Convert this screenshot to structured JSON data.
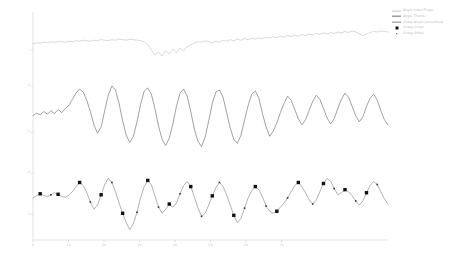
{
  "chart_data": {
    "type": "line",
    "title": "",
    "xlabel": "",
    "ylabel": "",
    "xlim": [
      0,
      100
    ],
    "ylim": [
      -3.2,
      1.2
    ],
    "grid": false,
    "legend_position": "upper right",
    "xticks": [
      0,
      10,
      20,
      30,
      40,
      50,
      60,
      70
    ],
    "xticklabels": [
      "0",
      "10",
      "20",
      "30",
      "40",
      "50",
      "60",
      "70"
    ],
    "yticks": [
      0.5,
      -0.2,
      -1.1,
      -1.9,
      -2.7
    ],
    "yticklabels": [
      "1",
      "0",
      "-1",
      "-2",
      "-3"
    ],
    "series": [
      {
        "name": "Angle Index Finger",
        "color": "#c4c4c4",
        "offset": 0.62,
        "values": [
          0.0,
          0.02,
          0.01,
          0.03,
          0.02,
          0.04,
          0.03,
          0.05,
          0.04,
          0.03,
          0.05,
          0.04,
          0.06,
          0.05,
          0.07,
          0.06,
          0.05,
          0.07,
          0.06,
          0.08,
          0.07,
          0.06,
          0.08,
          0.07,
          0.09,
          0.08,
          0.07,
          0.09,
          0.08,
          0.07,
          0.06,
          0.04,
          -0.02,
          -0.12,
          -0.22,
          -0.16,
          -0.24,
          -0.13,
          -0.2,
          -0.1,
          -0.18,
          -0.08,
          -0.14,
          -0.05,
          -0.02,
          0.02,
          0.04,
          0.03,
          0.06,
          0.04,
          0.02,
          0.05,
          0.03,
          0.07,
          0.05,
          0.08,
          0.06,
          0.09,
          0.07,
          0.1,
          0.08,
          0.11,
          0.09,
          0.12,
          0.1,
          0.13,
          0.11,
          0.14,
          0.12,
          0.15,
          0.13,
          0.16,
          0.14,
          0.17,
          0.15,
          0.18,
          0.16,
          0.19,
          0.17,
          0.2,
          0.18,
          0.21,
          0.19,
          0.22,
          0.2,
          0.23,
          0.21,
          0.24,
          0.22,
          0.25,
          0.23,
          0.2,
          0.16,
          0.19,
          0.22,
          0.24,
          0.23,
          0.25,
          0.24,
          0.23
        ]
      },
      {
        "name": "Angle Thumb",
        "color": "#6d6d6d",
        "offset": -0.78,
        "values": [
          0.0,
          0.05,
          0.02,
          0.08,
          0.03,
          0.1,
          0.04,
          0.12,
          0.06,
          0.14,
          0.2,
          0.32,
          0.44,
          0.52,
          0.46,
          0.3,
          0.08,
          -0.18,
          -0.34,
          -0.22,
          0.1,
          0.4,
          0.58,
          0.5,
          0.24,
          -0.1,
          -0.38,
          -0.52,
          -0.4,
          -0.12,
          0.22,
          0.48,
          0.54,
          0.42,
          0.14,
          -0.2,
          -0.46,
          -0.58,
          -0.44,
          -0.16,
          0.18,
          0.44,
          0.52,
          0.38,
          0.08,
          -0.26,
          -0.5,
          -0.6,
          -0.42,
          -0.1,
          0.24,
          0.46,
          0.5,
          0.36,
          0.06,
          -0.24,
          -0.46,
          -0.54,
          -0.38,
          -0.08,
          0.2,
          0.42,
          0.48,
          0.34,
          0.04,
          -0.22,
          -0.4,
          -0.3,
          -0.14,
          0.06,
          0.24,
          0.38,
          0.3,
          0.12,
          -0.06,
          -0.18,
          -0.08,
          0.1,
          0.28,
          0.4,
          0.32,
          0.14,
          -0.04,
          -0.16,
          -0.06,
          0.14,
          0.32,
          0.44,
          0.36,
          0.18,
          0.0,
          -0.12,
          -0.02,
          0.18,
          0.34,
          0.42,
          0.3,
          0.1,
          -0.08,
          -0.18
        ]
      },
      {
        "name": "Grasp Angle (smoothed)",
        "color": "#888888",
        "offset": -2.38,
        "values": [
          0.0,
          0.04,
          0.08,
          0.05,
          0.02,
          0.06,
          0.1,
          0.07,
          0.03,
          0.01,
          0.05,
          0.12,
          0.22,
          0.3,
          0.24,
          0.1,
          -0.08,
          -0.22,
          -0.14,
          0.06,
          0.26,
          0.38,
          0.3,
          0.12,
          -0.1,
          -0.3,
          -0.48,
          -0.62,
          -0.5,
          -0.28,
          0.0,
          0.22,
          0.34,
          0.26,
          0.04,
          -0.18,
          -0.3,
          -0.22,
          -0.12,
          -0.18,
          -0.1,
          0.08,
          0.24,
          0.32,
          0.22,
          0.02,
          -0.2,
          -0.36,
          -0.3,
          -0.14,
          0.04,
          0.2,
          0.3,
          0.22,
          0.06,
          -0.14,
          -0.34,
          -0.48,
          -0.4,
          -0.2,
          0.0,
          0.14,
          0.22,
          0.16,
          0.02,
          -0.16,
          -0.26,
          -0.3,
          -0.26,
          -0.18,
          -0.1,
          0.0,
          0.12,
          0.24,
          0.3,
          0.22,
          0.1,
          -0.04,
          -0.12,
          -0.04,
          0.12,
          0.28,
          0.38,
          0.32,
          0.18,
          0.06,
          0.1,
          0.16,
          0.12,
          0.04,
          -0.06,
          -0.14,
          -0.06,
          0.1,
          0.24,
          0.32,
          0.26,
          0.12,
          -0.02,
          -0.12
        ]
      }
    ],
    "markers": [
      {
        "name": "Grasp Onset",
        "color": "#111111",
        "shape": "square",
        "points": [
          [
            2,
            0.06
          ],
          [
            7,
            0.06
          ],
          [
            13,
            0.26
          ],
          [
            19,
            0.02
          ],
          [
            25,
            -0.28
          ],
          [
            32,
            0.28
          ],
          [
            38,
            -0.26
          ],
          [
            44,
            0.28
          ],
          [
            50,
            0.02
          ],
          [
            57,
            -0.46
          ],
          [
            63,
            0.18
          ],
          [
            69,
            -0.28
          ],
          [
            75,
            0.26
          ],
          [
            82,
            0.3
          ],
          [
            88,
            0.08
          ],
          [
            94,
            0.26
          ]
        ]
      },
      {
        "name": "Grasp Offset",
        "color": "#333333",
        "shape": "point",
        "points": [
          [
            5,
            0.04
          ],
          [
            16,
            -0.04
          ],
          [
            22,
            0.3
          ],
          [
            29,
            -0.34
          ],
          [
            35,
            -0.16
          ],
          [
            41,
            0.1
          ],
          [
            47,
            -0.34
          ],
          [
            53,
            0.2
          ],
          [
            60,
            0.0
          ],
          [
            66,
            -0.24
          ],
          [
            72,
            0.06
          ],
          [
            79,
            -0.1
          ],
          [
            85,
            0.14
          ],
          [
            91,
            -0.12
          ],
          [
            97,
            0.16
          ]
        ]
      }
    ]
  },
  "legend": {
    "items": [
      {
        "label": "Angle Index Finger",
        "type": "line",
        "color": "#c4c4c4"
      },
      {
        "label": "Angle Thumb",
        "type": "line",
        "color": "#6d6d6d"
      },
      {
        "label": "Grasp Angle (smoothed)",
        "type": "line",
        "color": "#888888"
      },
      {
        "label": "Grasp Onset",
        "type": "square",
        "color": "#111111"
      },
      {
        "label": "Grasp Offset",
        "type": "point",
        "color": "#333333"
      }
    ]
  },
  "axes": {
    "spine_color": "#d6d6d6",
    "tick_color": "#c9c9c9",
    "background": "#ffffff"
  }
}
